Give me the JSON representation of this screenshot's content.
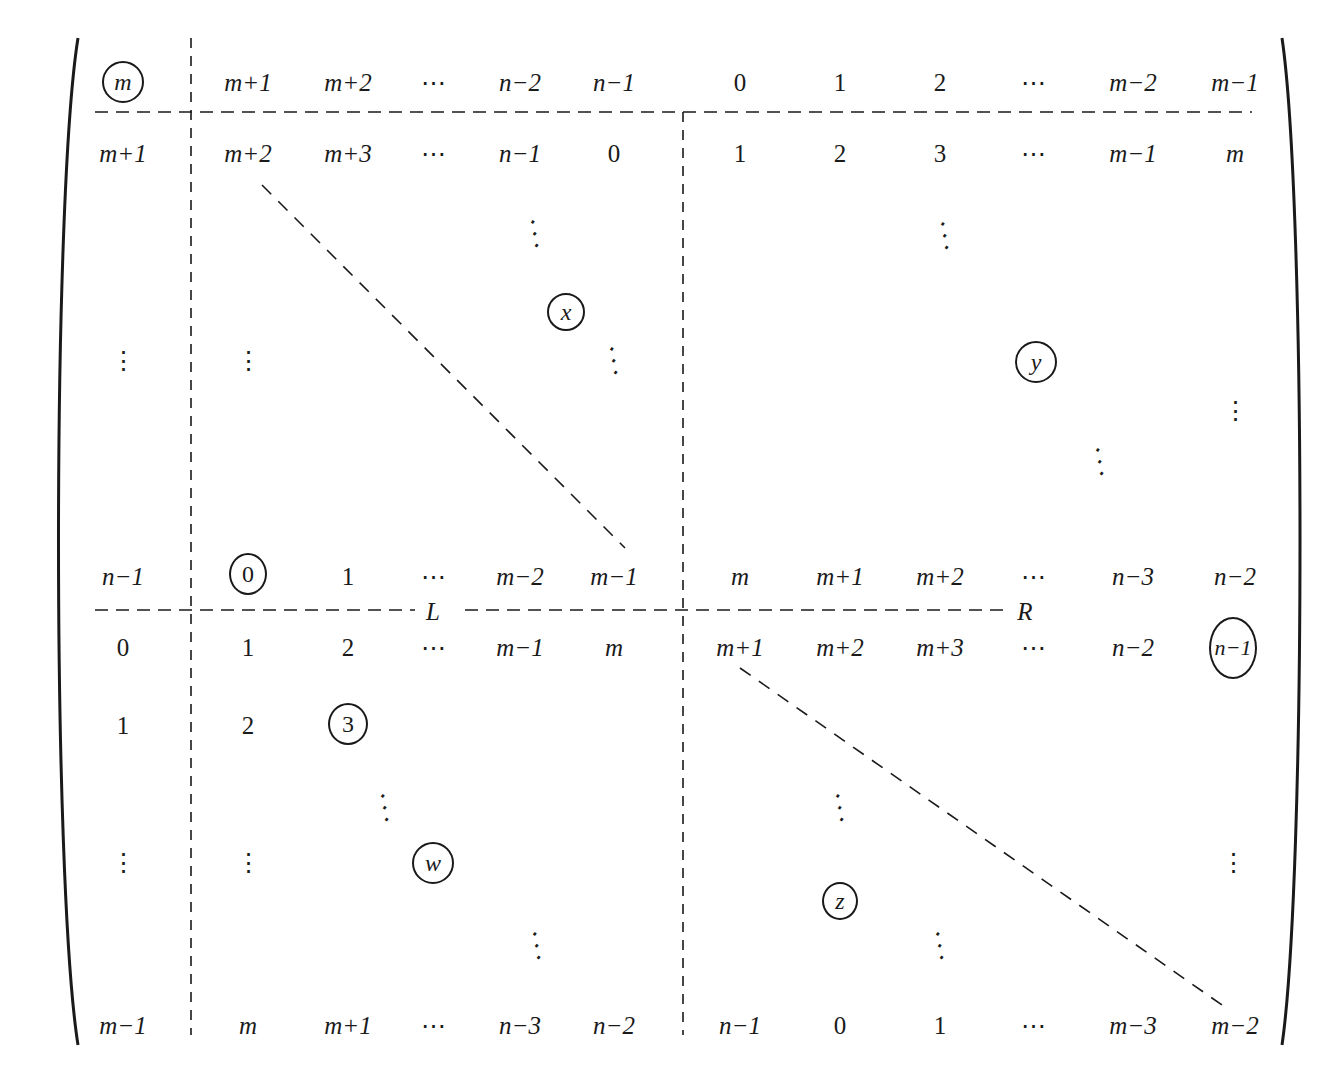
{
  "figure": {
    "type": "block matrix",
    "rows": [
      {
        "id": "r0",
        "cells": [
          "m",
          "m+1",
          "m+2",
          "⋯",
          "n−2",
          "n−1",
          "0",
          "1",
          "2",
          "⋯",
          "m−2",
          "m−1"
        ],
        "circled": [
          0
        ]
      },
      {
        "id": "r1",
        "cells": [
          "m+1",
          "m+2",
          "m+3",
          "⋯",
          "n−1",
          "0",
          "1",
          "2",
          "3",
          "⋯",
          "m−1",
          "m"
        ]
      },
      {
        "id": "r_dots",
        "cells": [
          "⋮",
          "⋮",
          "",
          "",
          "",
          "",
          "",
          "",
          "",
          "",
          "",
          "⋮"
        ]
      },
      {
        "id": "r_nm1",
        "cells": [
          "n−1",
          "0",
          "1",
          "⋯",
          "m−2",
          "m−1",
          "m",
          "m+1",
          "m+2",
          "⋯",
          "n−3",
          "n−2"
        ],
        "circled": [
          1
        ]
      },
      {
        "id": "r_zero",
        "cells": [
          "0",
          "1",
          "2",
          "⋯",
          "m−1",
          "m",
          "m+1",
          "m+2",
          "m+3",
          "⋯",
          "n−2",
          "n−1"
        ],
        "circled": [
          11
        ]
      },
      {
        "id": "r_one",
        "cells": [
          "1",
          "2",
          "3",
          "",
          "",
          "",
          "",
          "",
          "",
          "",
          "",
          ""
        ],
        "circled": [
          2
        ]
      },
      {
        "id": "r_dots2",
        "cells": [
          "⋮",
          "⋮",
          "",
          "",
          "",
          "",
          "",
          "",
          "",
          "",
          "",
          "⋮"
        ]
      },
      {
        "id": "r_last",
        "cells": [
          "m−1",
          "m",
          "m+1",
          "⋯",
          "n−3",
          "n−2",
          "n−1",
          "0",
          "1",
          "⋯",
          "m−3",
          "m−2"
        ]
      }
    ],
    "circled_blocks": {
      "x": "x",
      "y": "y",
      "w": "w",
      "z": "z"
    },
    "labels": {
      "L": "L",
      "R": "R"
    },
    "ddots": "⋱",
    "vdots": "⋮",
    "hdots": "⋯"
  }
}
